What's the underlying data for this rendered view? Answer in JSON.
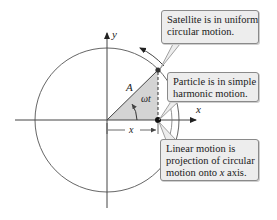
{
  "diagram": {
    "axes": {
      "x_label": "x",
      "y_label": "y"
    },
    "labels": {
      "amplitude": "A",
      "angle": "ωt",
      "displacement": "x"
    },
    "callouts": [
      {
        "id": "satellite",
        "lines": [
          "Satellite is in uniform",
          "circular motion."
        ]
      },
      {
        "id": "particle",
        "lines": [
          "Particle is in simple",
          "harmonic motion."
        ]
      },
      {
        "id": "linear",
        "lines": [
          "Linear motion is",
          "projection of circular",
          "motion onto "
        ],
        "italic_word": "x",
        "tail": " axis."
      }
    ],
    "colors": {
      "stroke": "#555555",
      "axis": "#444444",
      "wedge_fill": "#d4d4d4",
      "callout_fill": "#ededed",
      "callout_border": "#8a8a8a"
    }
  }
}
